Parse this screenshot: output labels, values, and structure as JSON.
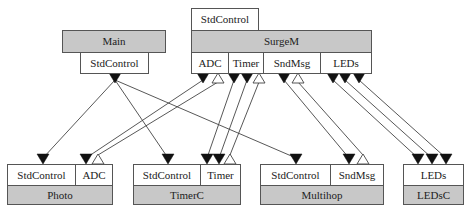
{
  "diagram": {
    "type": "component-wiring",
    "components": [
      {
        "id": "main",
        "name": "Main",
        "header_position": "top",
        "interfaces": [
          {
            "label": "StdControl",
            "role": "uses"
          }
        ]
      },
      {
        "id": "surgem",
        "name": "SurgeM",
        "provides": [
          {
            "label": "StdControl"
          }
        ],
        "uses": [
          {
            "label": "ADC"
          },
          {
            "label": "Timer"
          },
          {
            "label": "SndMsg"
          },
          {
            "label": "LEDs"
          }
        ]
      },
      {
        "id": "photo",
        "name": "Photo",
        "interfaces": [
          {
            "label": "StdControl"
          },
          {
            "label": "ADC"
          }
        ]
      },
      {
        "id": "timerc",
        "name": "TimerC",
        "interfaces": [
          {
            "label": "StdControl"
          },
          {
            "label": "Timer"
          }
        ]
      },
      {
        "id": "multihop",
        "name": "Multihop",
        "interfaces": [
          {
            "label": "StdControl"
          },
          {
            "label": "SndMsg"
          }
        ]
      },
      {
        "id": "ledsc",
        "name": "LEDsC",
        "interfaces": [
          {
            "label": "LEDs"
          }
        ]
      }
    ],
    "connections": [
      {
        "from": "Main.StdControl",
        "to": "Photo.StdControl"
      },
      {
        "from": "Main.StdControl",
        "to": "TimerC.StdControl"
      },
      {
        "from": "Main.StdControl",
        "to": "Multihop.StdControl"
      },
      {
        "from": "SurgeM.ADC",
        "to": "Photo.ADC",
        "kind": "command"
      },
      {
        "from": "Photo.ADC",
        "to": "SurgeM.ADC",
        "kind": "event"
      },
      {
        "from": "SurgeM.Timer",
        "to": "TimerC.Timer",
        "kind": "command"
      },
      {
        "from": "SurgeM.Timer",
        "to": "TimerC.Timer",
        "kind": "command"
      },
      {
        "from": "TimerC.Timer",
        "to": "SurgeM.Timer",
        "kind": "event"
      },
      {
        "from": "SurgeM.SndMsg",
        "to": "Multihop.SndMsg",
        "kind": "command"
      },
      {
        "from": "Multihop.SndMsg",
        "to": "SurgeM.SndMsg",
        "kind": "event"
      },
      {
        "from": "SurgeM.LEDs",
        "to": "LEDsC.LEDs",
        "kind": "command"
      },
      {
        "from": "SurgeM.LEDs",
        "to": "LEDsC.LEDs",
        "kind": "command"
      },
      {
        "from": "SurgeM.LEDs",
        "to": "LEDsC.LEDs",
        "kind": "command"
      }
    ],
    "colors": {
      "component_fill": "#c8c8c8",
      "interface_fill": "#ffffff",
      "stroke": "#555555",
      "arrow_fill": "#111111"
    }
  }
}
